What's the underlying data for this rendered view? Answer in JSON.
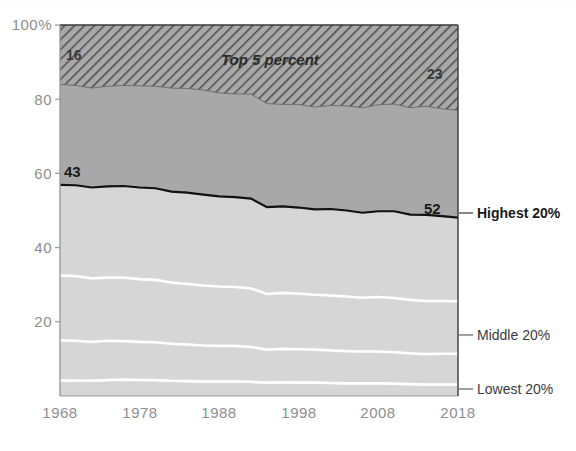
{
  "chart_data": {
    "type": "area",
    "title": "",
    "subtitle": "",
    "xlabel": "",
    "ylabel": "",
    "xlim": [
      1968,
      2018
    ],
    "ylim": [
      0,
      100
    ],
    "grid": false,
    "legend_position": "right-inline",
    "stacked": true,
    "y_ticks": [
      "100%",
      "80",
      "60",
      "40",
      "20"
    ],
    "y_tick_values": [
      100,
      80,
      60,
      40,
      20
    ],
    "x_ticks": [
      "1968",
      "1978",
      "1988",
      "1998",
      "2008",
      "2018"
    ],
    "x_tick_values": [
      1968,
      1978,
      1988,
      1998,
      2008,
      2018
    ],
    "x": [
      1968,
      1970,
      1972,
      1974,
      1976,
      1978,
      1980,
      1982,
      1984,
      1986,
      1988,
      1990,
      1992,
      1994,
      1996,
      1998,
      2000,
      2002,
      2004,
      2006,
      2008,
      2010,
      2012,
      2014,
      2016,
      2018
    ],
    "series": [
      {
        "name": "Lowest 20%",
        "label": "Lowest 20%",
        "values": [
          4.2,
          4.1,
          4.1,
          4.3,
          4.4,
          4.3,
          4.3,
          4.1,
          4.0,
          3.9,
          3.9,
          3.9,
          3.8,
          3.6,
          3.7,
          3.6,
          3.6,
          3.5,
          3.4,
          3.4,
          3.4,
          3.3,
          3.2,
          3.1,
          3.1,
          3.1
        ]
      },
      {
        "name": "Second 20%",
        "label": "",
        "values": [
          10.8,
          10.8,
          10.5,
          10.6,
          10.4,
          10.3,
          10.2,
          10.0,
          9.9,
          9.7,
          9.6,
          9.6,
          9.4,
          8.9,
          9.0,
          9.0,
          8.9,
          8.8,
          8.7,
          8.6,
          8.6,
          8.5,
          8.3,
          8.2,
          8.3,
          8.3
        ]
      },
      {
        "name": "Middle 20%",
        "label": "Middle 20%",
        "values": [
          17.5,
          17.4,
          17.1,
          17.0,
          17.1,
          16.9,
          16.8,
          16.5,
          16.3,
          16.2,
          16.0,
          15.9,
          15.8,
          15.0,
          15.1,
          15.0,
          14.8,
          14.8,
          14.7,
          14.5,
          14.7,
          14.6,
          14.4,
          14.3,
          14.2,
          14.1
        ]
      },
      {
        "name": "Fourth 20%",
        "label": "",
        "values": [
          24.4,
          24.5,
          24.5,
          24.6,
          24.7,
          24.7,
          24.7,
          24.5,
          24.6,
          24.5,
          24.3,
          24.2,
          24.2,
          23.4,
          23.3,
          23.2,
          23.0,
          23.3,
          23.2,
          22.9,
          23.1,
          23.4,
          23.0,
          23.2,
          22.9,
          22.6
        ]
      },
      {
        "name": "Highest 20%",
        "label": "Highest 20%",
        "values": [
          43.0,
          43.3,
          43.9,
          43.6,
          43.5,
          43.7,
          44.1,
          45.0,
          45.2,
          45.7,
          46.3,
          46.6,
          46.9,
          49.1,
          49.0,
          49.2,
          49.8,
          49.7,
          50.1,
          50.5,
          50.2,
          50.3,
          51.0,
          51.2,
          51.5,
          51.9
        ]
      }
    ],
    "hatched_band": {
      "name": "Top 5 percent",
      "label": "Top 5 percent",
      "description": "Hatched sub-band inside the Highest 20% band, measured down from 100%",
      "values": [
        16.0,
        16.3,
        17.0,
        16.5,
        16.3,
        16.4,
        16.5,
        17.0,
        17.1,
        17.5,
        18.3,
        18.6,
        18.6,
        21.2,
        21.4,
        21.4,
        22.1,
        21.7,
        21.8,
        22.3,
        21.5,
        21.3,
        22.3,
        21.9,
        22.6,
        23.0
      ]
    },
    "annotations": [
      {
        "name": "start-highest-20",
        "text": "43",
        "value": 43,
        "position": "left-inside-top"
      },
      {
        "name": "end-highest-20",
        "text": "52",
        "value": 52,
        "position": "right-inside-top"
      },
      {
        "name": "start-top-5",
        "text": "16",
        "value": 16,
        "position": "left-inside-hatch"
      },
      {
        "name": "end-top-5",
        "text": "23",
        "value": 23,
        "position": "right-inside-hatch"
      },
      {
        "name": "band-label-top-5",
        "text": "Top 5 percent",
        "position": "center-hatch"
      }
    ],
    "colors": {
      "highest_band": "#a8a8a8",
      "hatch_stroke": "#4a4a4a",
      "lower_bands": "#d6d6d6",
      "divider_line": "#ffffff",
      "top_line": "#1a1a1a",
      "axis_text": "#8e8e8e",
      "annotation_text": "#1a1a1a",
      "background": "#ffffff"
    }
  },
  "labels": {
    "y_100": "100%",
    "y_80": "80",
    "y_60": "60",
    "y_40": "40",
    "y_20": "20",
    "x_1968": "1968",
    "x_1978": "1978",
    "x_1988": "1988",
    "x_1998": "1998",
    "x_2008": "2008",
    "x_2018": "2018",
    "a_16": "16",
    "a_23": "23",
    "a_43": "43",
    "a_52": "52",
    "top5": "Top 5 percent",
    "highest20": "Highest 20%",
    "middle20": "Middle 20%",
    "lowest20": "Lowest 20%"
  }
}
